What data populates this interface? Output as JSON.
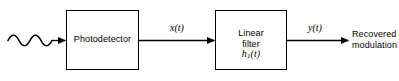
{
  "diagram": {
    "type": "block-diagram",
    "background_color": "#ffffff",
    "line_color": "#000000",
    "blocks": [
      {
        "id": "photodetector",
        "label": "Photodetector",
        "x": 66,
        "y": 10,
        "width": 73,
        "height": 60
      },
      {
        "id": "linear-filter",
        "label_line1": "Linear",
        "label_line2": "filter",
        "impulse_response": "h",
        "impulse_subscript": "1",
        "impulse_argument": "(t)",
        "x": 215,
        "y": 10,
        "width": 72,
        "height": 60
      }
    ],
    "signals": {
      "input_waveform": "optical-input-wave",
      "x_label": "x(t)",
      "y_label": "y(t)"
    },
    "output": {
      "line1": "Recovered",
      "line2": "modulation"
    }
  }
}
